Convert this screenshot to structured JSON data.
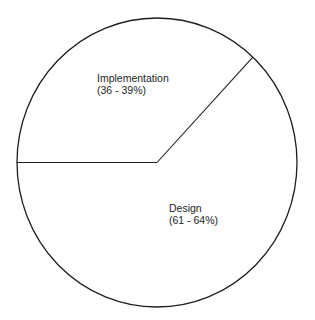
{
  "chart_data": {
    "type": "pie",
    "title": "",
    "start_angle_deg": 180,
    "direction": "clockwise",
    "colors": {
      "outline": "#1e1e1e",
      "fill": "#ffffff",
      "text": "#1e1e1e"
    },
    "slices": [
      {
        "name": "Implementation",
        "range_label": "(36 - 39%)",
        "range": [
          36,
          39
        ],
        "value": 37
      },
      {
        "name": "Design",
        "range_label": "(61 - 64%)",
        "range": [
          61,
          64
        ],
        "value": 63
      }
    ]
  }
}
